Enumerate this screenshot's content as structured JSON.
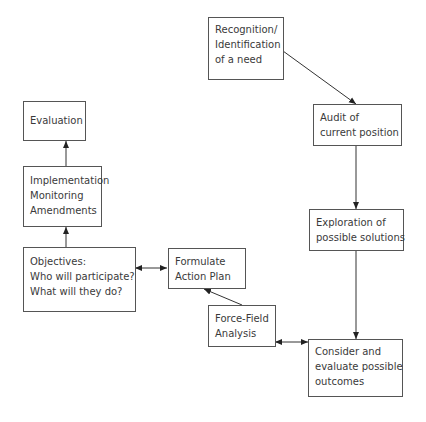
{
  "diagram": {
    "type": "flowchart",
    "nodes": [
      {
        "id": "recognition",
        "lines": [
          "Recognition/",
          "Identification",
          "of a need"
        ]
      },
      {
        "id": "audit",
        "lines": [
          "Audit of",
          "current position"
        ]
      },
      {
        "id": "exploration",
        "lines": [
          "Exploration of",
          "possible solutions"
        ]
      },
      {
        "id": "consider",
        "lines": [
          "Consider and",
          "evaluate possible",
          "outcomes"
        ]
      },
      {
        "id": "forcefield",
        "lines": [
          "Force-Field",
          "Analysis"
        ]
      },
      {
        "id": "formulate",
        "lines": [
          "Formulate",
          "Action Plan"
        ]
      },
      {
        "id": "objectives",
        "lines": [
          "Objectives:",
          "Who will participate?",
          "What will they do?"
        ]
      },
      {
        "id": "implementation",
        "lines": [
          "Implementation",
          "Monitoring",
          "Amendments"
        ]
      },
      {
        "id": "evaluation",
        "lines": [
          "Evaluation"
        ]
      }
    ],
    "edges": [
      {
        "from": "recognition",
        "to": "audit",
        "type": "arrow"
      },
      {
        "from": "audit",
        "to": "exploration",
        "type": "arrow"
      },
      {
        "from": "exploration",
        "to": "consider",
        "type": "arrow"
      },
      {
        "from": "consider",
        "to": "forcefield",
        "type": "double-arrow"
      },
      {
        "from": "forcefield",
        "to": "formulate",
        "type": "arrow"
      },
      {
        "from": "formulate",
        "to": "objectives",
        "type": "double-arrow"
      },
      {
        "from": "objectives",
        "to": "implementation",
        "type": "arrow"
      },
      {
        "from": "implementation",
        "to": "evaluation",
        "type": "arrow"
      }
    ]
  }
}
